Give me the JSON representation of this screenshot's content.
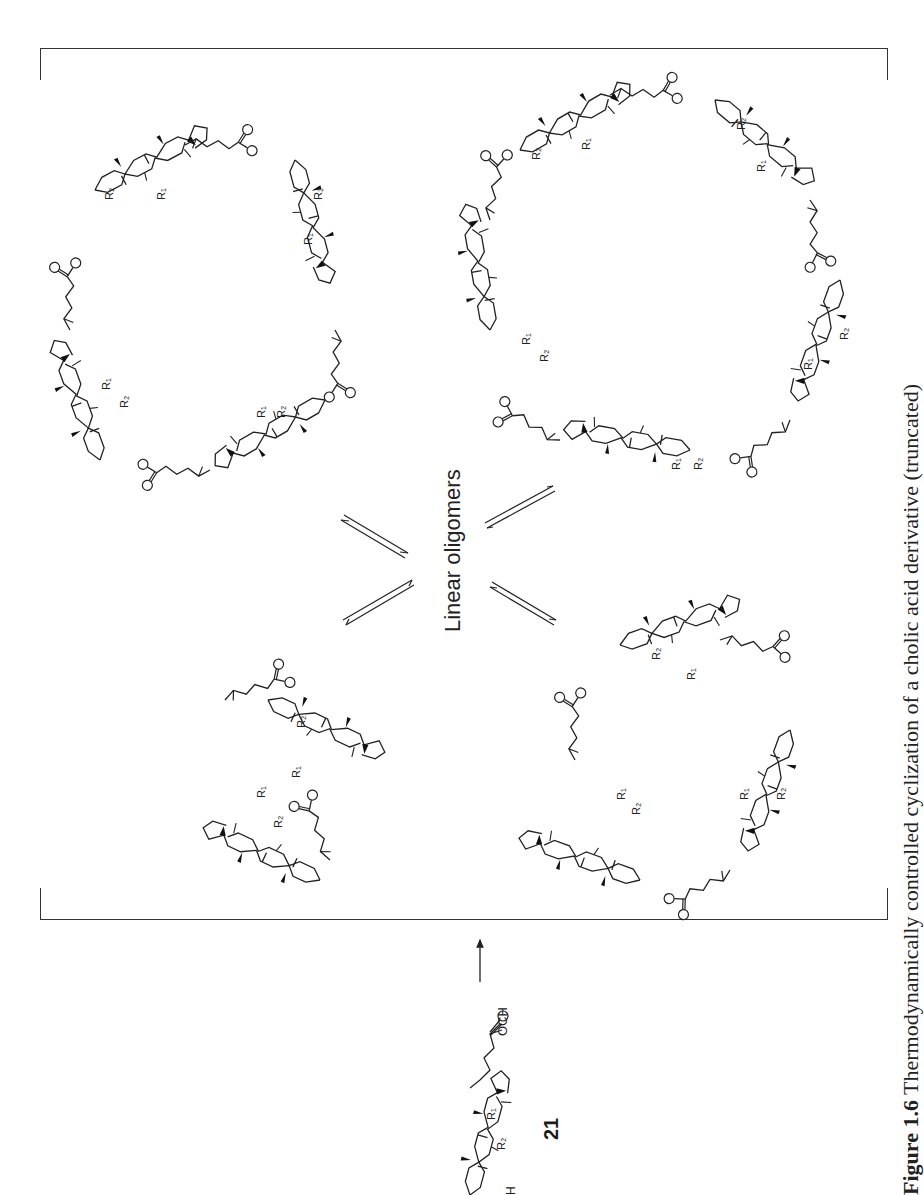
{
  "figure": {
    "center_label": "Linear oligomers",
    "compound": {
      "number": "21",
      "groups": {
        "ester": "OCH3",
        "carbonyl_o": "O",
        "hydroxyl": "H",
        "r1": "R1",
        "r2": "R2"
      }
    },
    "macrocycles": [
      {
        "position": "top-left",
        "units": 3
      },
      {
        "position": "top-right",
        "units": 4
      },
      {
        "position": "bottom-left",
        "units": 2
      },
      {
        "position": "bottom-right",
        "units": 3
      }
    ],
    "atom_labels": {
      "o": "O",
      "r1": "R",
      "r1_sub": "1",
      "r2": "R",
      "r2_sub": "2",
      "och3": "OCH",
      "och3_sub": "3",
      "h": "H"
    },
    "caption": {
      "prefix": "Figure 1.6",
      "text": "Thermodynamically controlled cyclization of a cholic acid derivative (truncated)"
    }
  }
}
